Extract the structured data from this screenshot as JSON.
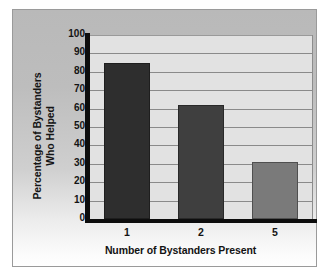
{
  "chart_data": {
    "type": "bar",
    "title": "",
    "subtitle": "",
    "xlabel": "Number of Bystanders Present",
    "ylabel": "Percentage of Bystanders Who Helped",
    "ylabel_line1": "Percentage of Bystanders",
    "ylabel_line2": "Who Helped",
    "categories": [
      "1",
      "2",
      "5"
    ],
    "values": [
      85,
      62,
      31
    ],
    "series": [
      {
        "name": "Percentage of Bystanders Who Helped",
        "values": [
          85,
          62,
          31
        ]
      }
    ],
    "ylim": [
      0,
      100
    ],
    "ytick_values": [
      0,
      10,
      20,
      30,
      40,
      50,
      60,
      70,
      80,
      90,
      100
    ],
    "ytick_labels": [
      "0",
      "10",
      "20",
      "30",
      "40",
      "50",
      "60",
      "70",
      "80",
      "90",
      "100"
    ],
    "ytick_step": 10,
    "grid": "horizontal",
    "legend": "none",
    "annotations": [],
    "bar_colors": [
      "#2e2e2e",
      "#3f3f3f",
      "#7a7a7a"
    ]
  },
  "style": {
    "page_background": "#ffffff",
    "panel_border_color": "#9a9a9a",
    "panel_gradient_top": "#b9b9b9",
    "panel_gradient_bottom": "#ffffff",
    "plot_background": "#e2e2e2",
    "gridline_color": "#8a8a8a",
    "axis_color": "#0d0d0d",
    "text_color": "#141414"
  }
}
